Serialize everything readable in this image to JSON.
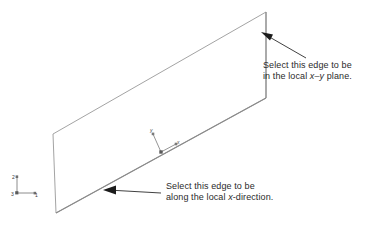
{
  "figure": {
    "background_color": "#ffffff",
    "line_color": "#8c8c8c",
    "text_color": "#2b2b2b"
  },
  "callouts": [
    {
      "id": "xy-plane",
      "line1": "Select this edge to be",
      "line2_prefix": "in the local ",
      "line2_italic": "x–y",
      "line2_suffix": " plane.",
      "arrow_tip": {
        "x": 262,
        "y": 33
      },
      "arrow_tail": {
        "x": 306,
        "y": 58
      }
    },
    {
      "id": "x-direction",
      "line1": "Select this edge to be",
      "line2_prefix": "along the local ",
      "line2_italic": "x",
      "line2_suffix": "-direction.",
      "arrow_tip": {
        "x": 104,
        "y": 190
      },
      "arrow_tail": {
        "x": 161,
        "y": 193
      }
    }
  ],
  "plate": {
    "shape": "parallelogram",
    "corners": [
      {
        "name": "top-left",
        "x": 53,
        "y": 134
      },
      {
        "name": "top-right",
        "x": 266,
        "y": 12
      },
      {
        "name": "bottom-right",
        "x": 266,
        "y": 98
      },
      {
        "name": "bottom-left",
        "x": 56,
        "y": 213
      }
    ]
  },
  "global_triad": {
    "name": "global-coordinate-triad",
    "origin": {
      "x": 17,
      "y": 193
    },
    "axes": [
      {
        "label": "2",
        "direction": "up",
        "end": {
          "x": 17,
          "y": 176
        }
      },
      {
        "label": "1",
        "direction": "right",
        "end": {
          "x": 36,
          "y": 193
        }
      },
      {
        "label": "3",
        "direction": "origin",
        "end": {
          "x": 17,
          "y": 193
        }
      }
    ]
  },
  "local_triad": {
    "name": "local-coordinate-triad",
    "origin": {
      "x": 161,
      "y": 152
    },
    "axes": [
      {
        "label": "y",
        "end": {
          "x": 152,
          "y": 133
        }
      },
      {
        "label": "x",
        "end": {
          "x": 176,
          "y": 144
        }
      }
    ]
  }
}
